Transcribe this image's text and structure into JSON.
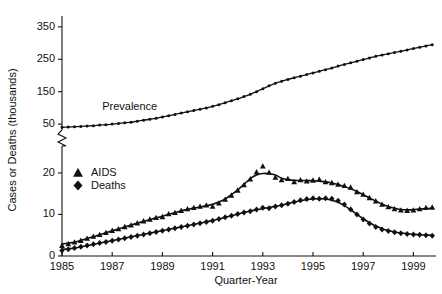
{
  "chart_data": {
    "type": "line",
    "title": "",
    "subtitle": "",
    "xlabel": "Quarter-Year",
    "ylabel": "Cases or Deaths (thousands)",
    "grid": false,
    "legend_position": "inside-upper-left",
    "axis_note": "broken y-axis: lower segment 0-20, upper segment 50-350",
    "xtick_labels": [
      "1985",
      "1987",
      "1989",
      "1991",
      "1993",
      "1995",
      "1997",
      "1999"
    ],
    "xticks": [
      1985,
      1987,
      1989,
      1991,
      1993,
      1995,
      1997,
      1999
    ],
    "xlim": [
      1985,
      1999.9
    ],
    "ytick_labels_lower": [
      "0",
      "10",
      "20"
    ],
    "ytick_labels_upper": [
      "50",
      "150",
      "250",
      "350"
    ],
    "yticks_lower": [
      0,
      10,
      20
    ],
    "yticks_upper": [
      50,
      150,
      250,
      350
    ],
    "ylim_lower": [
      0,
      26
    ],
    "ylim_upper": [
      38,
      365
    ],
    "annotations": [
      {
        "text": "Prevalence",
        "x": 1986.6,
        "y": 95
      }
    ],
    "legend": [
      {
        "label": "AIDS",
        "marker": "triangle"
      },
      {
        "label": "Deaths",
        "marker": "diamond"
      }
    ],
    "series": [
      {
        "name": "Prevalence",
        "marker": "dot",
        "axis": "upper",
        "x": [
          1985.0,
          1985.25,
          1985.5,
          1985.75,
          1986.0,
          1986.25,
          1986.5,
          1986.75,
          1987.0,
          1987.25,
          1987.5,
          1987.75,
          1988.0,
          1988.25,
          1988.5,
          1988.75,
          1989.0,
          1989.25,
          1989.5,
          1989.75,
          1990.0,
          1990.25,
          1990.5,
          1990.75,
          1991.0,
          1991.25,
          1991.5,
          1991.75,
          1992.0,
          1992.25,
          1992.5,
          1992.75,
          1993.0,
          1993.25,
          1993.5,
          1993.75,
          1994.0,
          1994.25,
          1994.5,
          1994.75,
          1995.0,
          1995.25,
          1995.5,
          1995.75,
          1996.0,
          1996.25,
          1996.5,
          1996.75,
          1997.0,
          1997.25,
          1997.5,
          1997.75,
          1998.0,
          1998.25,
          1998.5,
          1998.75,
          1999.0,
          1999.25,
          1999.5,
          1999.75
        ],
        "y": [
          40,
          41,
          42,
          43,
          44,
          45,
          47,
          48,
          50,
          52,
          54,
          56,
          59,
          62,
          65,
          68,
          72,
          76,
          80,
          84,
          88,
          92,
          96,
          100,
          105,
          110,
          116,
          122,
          128,
          135,
          142,
          150,
          159,
          168,
          176,
          182,
          188,
          193,
          198,
          203,
          208,
          213,
          218,
          223,
          229,
          234,
          239,
          244,
          249,
          254,
          259,
          263,
          267,
          271,
          275,
          279,
          283,
          287,
          291,
          295
        ]
      },
      {
        "name": "AIDS",
        "marker": "triangle",
        "axis": "lower",
        "x": [
          1985.0,
          1985.25,
          1985.5,
          1985.75,
          1986.0,
          1986.25,
          1986.5,
          1986.75,
          1987.0,
          1987.25,
          1987.5,
          1987.75,
          1988.0,
          1988.25,
          1988.5,
          1988.75,
          1989.0,
          1989.25,
          1989.5,
          1989.75,
          1990.0,
          1990.25,
          1990.5,
          1990.75,
          1991.0,
          1991.25,
          1991.5,
          1991.75,
          1992.0,
          1992.25,
          1992.5,
          1992.75,
          1993.0,
          1993.25,
          1993.5,
          1993.75,
          1994.0,
          1994.25,
          1994.5,
          1994.75,
          1995.0,
          1995.25,
          1995.5,
          1995.75,
          1996.0,
          1996.25,
          1996.5,
          1996.75,
          1997.0,
          1997.25,
          1997.5,
          1997.75,
          1998.0,
          1998.25,
          1998.5,
          1998.75,
          1999.0,
          1999.25,
          1999.5,
          1999.75
        ],
        "y": [
          2.5,
          2.9,
          3.3,
          3.7,
          4.2,
          4.7,
          5.1,
          5.6,
          6.1,
          6.5,
          7.0,
          7.4,
          7.9,
          8.4,
          8.8,
          9.2,
          9.4,
          10.1,
          10.4,
          10.9,
          11.3,
          11.6,
          11.9,
          12.2,
          11.9,
          12.7,
          13.6,
          14.6,
          15.8,
          17.1,
          18.5,
          20.2,
          21.6,
          20.1,
          18.9,
          18.3,
          18.6,
          17.8,
          18.3,
          18.0,
          18.2,
          18.4,
          17.8,
          17.6,
          17.2,
          16.9,
          16.5,
          15.4,
          14.8,
          14.0,
          13.2,
          12.4,
          11.8,
          11.3,
          11.0,
          10.9,
          11.0,
          11.3,
          11.6,
          11.7
        ]
      },
      {
        "name": "Deaths",
        "marker": "diamond",
        "axis": "lower",
        "x": [
          1985.0,
          1985.25,
          1985.5,
          1985.75,
          1986.0,
          1986.25,
          1986.5,
          1986.75,
          1987.0,
          1987.25,
          1987.5,
          1987.75,
          1988.0,
          1988.25,
          1988.5,
          1988.75,
          1989.0,
          1989.25,
          1989.5,
          1989.75,
          1990.0,
          1990.25,
          1990.5,
          1990.75,
          1991.0,
          1991.25,
          1991.5,
          1991.75,
          1992.0,
          1992.25,
          1992.5,
          1992.75,
          1993.0,
          1993.25,
          1993.5,
          1993.75,
          1994.0,
          1994.25,
          1994.5,
          1994.75,
          1995.0,
          1995.25,
          1995.5,
          1995.75,
          1996.0,
          1996.25,
          1996.5,
          1996.75,
          1997.0,
          1997.25,
          1997.5,
          1997.75,
          1998.0,
          1998.25,
          1998.5,
          1998.75,
          1999.0,
          1999.25,
          1999.5,
          1999.75
        ],
        "y": [
          1.3,
          1.6,
          1.9,
          2.2,
          2.5,
          2.8,
          3.1,
          3.4,
          3.7,
          4.0,
          4.3,
          4.6,
          4.9,
          5.2,
          5.5,
          5.8,
          6.1,
          6.4,
          6.7,
          7.0,
          7.3,
          7.6,
          7.9,
          8.2,
          8.5,
          8.9,
          9.3,
          9.7,
          10.1,
          10.5,
          10.8,
          11.2,
          11.6,
          11.5,
          11.9,
          12.2,
          12.6,
          13.0,
          13.4,
          13.7,
          13.9,
          13.8,
          13.9,
          13.8,
          13.3,
          12.4,
          11.2,
          10.0,
          8.8,
          7.8,
          7.0,
          6.4,
          6.0,
          5.7,
          5.5,
          5.3,
          5.2,
          5.1,
          5.0,
          4.9
        ]
      }
    ]
  }
}
